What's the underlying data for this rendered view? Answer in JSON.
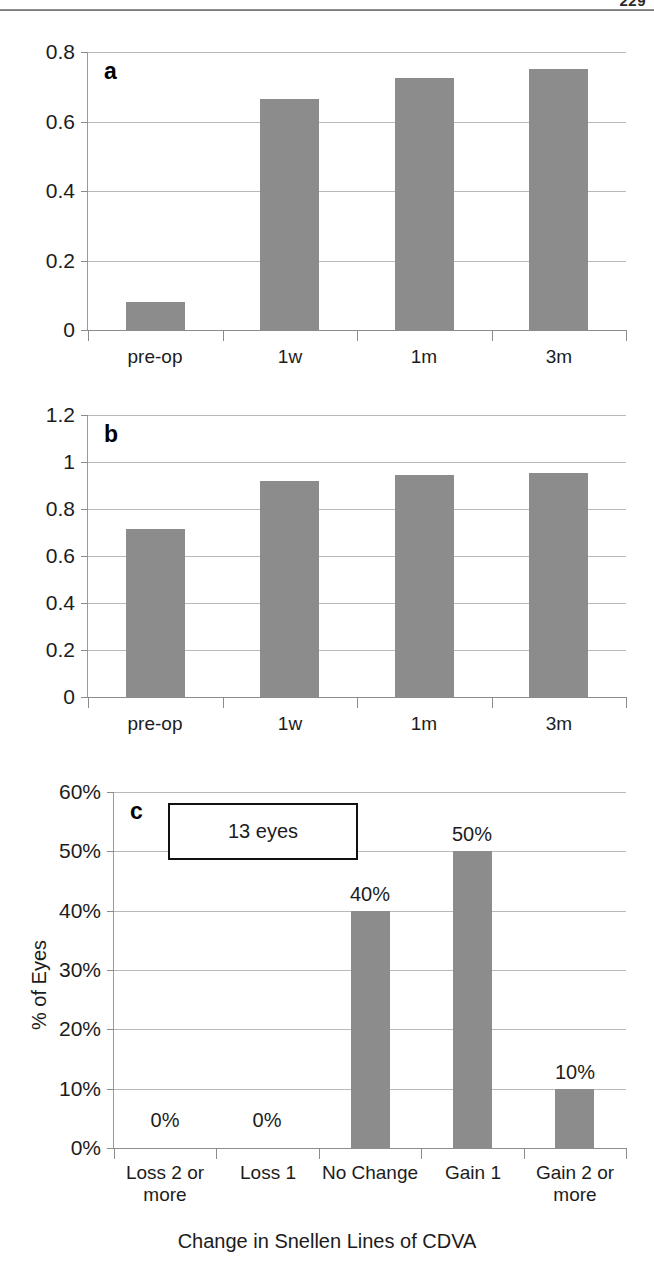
{
  "page": {
    "number": "229"
  },
  "charts": [
    {
      "panel": "a",
      "chart_data": {
        "type": "bar",
        "title": "",
        "xlabel": "",
        "ylabel": "",
        "categories": [
          "pre-op",
          "1w",
          "1m",
          "3m"
        ],
        "values": [
          0.08,
          0.665,
          0.725,
          0.75
        ],
        "ylim": [
          0,
          0.8
        ],
        "yticks": [
          0,
          0.2,
          0.4,
          0.6,
          0.8
        ],
        "ytick_labels": [
          "0",
          "0.2",
          "0.4",
          "0.6",
          "0.8"
        ],
        "grid": true,
        "legend": "none"
      }
    },
    {
      "panel": "b",
      "chart_data": {
        "type": "bar",
        "title": "",
        "xlabel": "",
        "ylabel": "",
        "categories": [
          "pre-op",
          "1w",
          "1m",
          "3m"
        ],
        "values": [
          0.715,
          0.92,
          0.945,
          0.952
        ],
        "ylim": [
          0,
          1.2
        ],
        "yticks": [
          0,
          0.2,
          0.4,
          0.6,
          0.8,
          1,
          1.2
        ],
        "ytick_labels": [
          "0",
          "0.2",
          "0.4",
          "0.6",
          "0.8",
          "1",
          "1.2"
        ],
        "grid": true,
        "legend": "none"
      }
    },
    {
      "panel": "c",
      "annotation": "13 eyes",
      "chart_data": {
        "type": "bar",
        "title": "",
        "xlabel": "Change in Snellen Lines of CDVA",
        "ylabel": "% of Eyes",
        "categories": [
          "Loss 2 or more",
          "Loss 1",
          "No Change",
          "Gain 1",
          "Gain 2 or more"
        ],
        "category_lines": [
          [
            "Loss 2 or",
            "more"
          ],
          [
            "Loss 1"
          ],
          [
            "No Change"
          ],
          [
            "Gain 1"
          ],
          [
            "Gain 2 or",
            "more"
          ]
        ],
        "values": [
          0,
          0,
          40,
          50,
          10
        ],
        "data_labels": [
          "0%",
          "0%",
          "40%",
          "50%",
          "10%"
        ],
        "ylim": [
          0,
          60
        ],
        "yticks": [
          0,
          10,
          20,
          30,
          40,
          50,
          60
        ],
        "ytick_labels": [
          "0%",
          "10%",
          "20%",
          "30%",
          "40%",
          "50%",
          "60%"
        ],
        "grid": true,
        "legend": "none"
      }
    }
  ]
}
